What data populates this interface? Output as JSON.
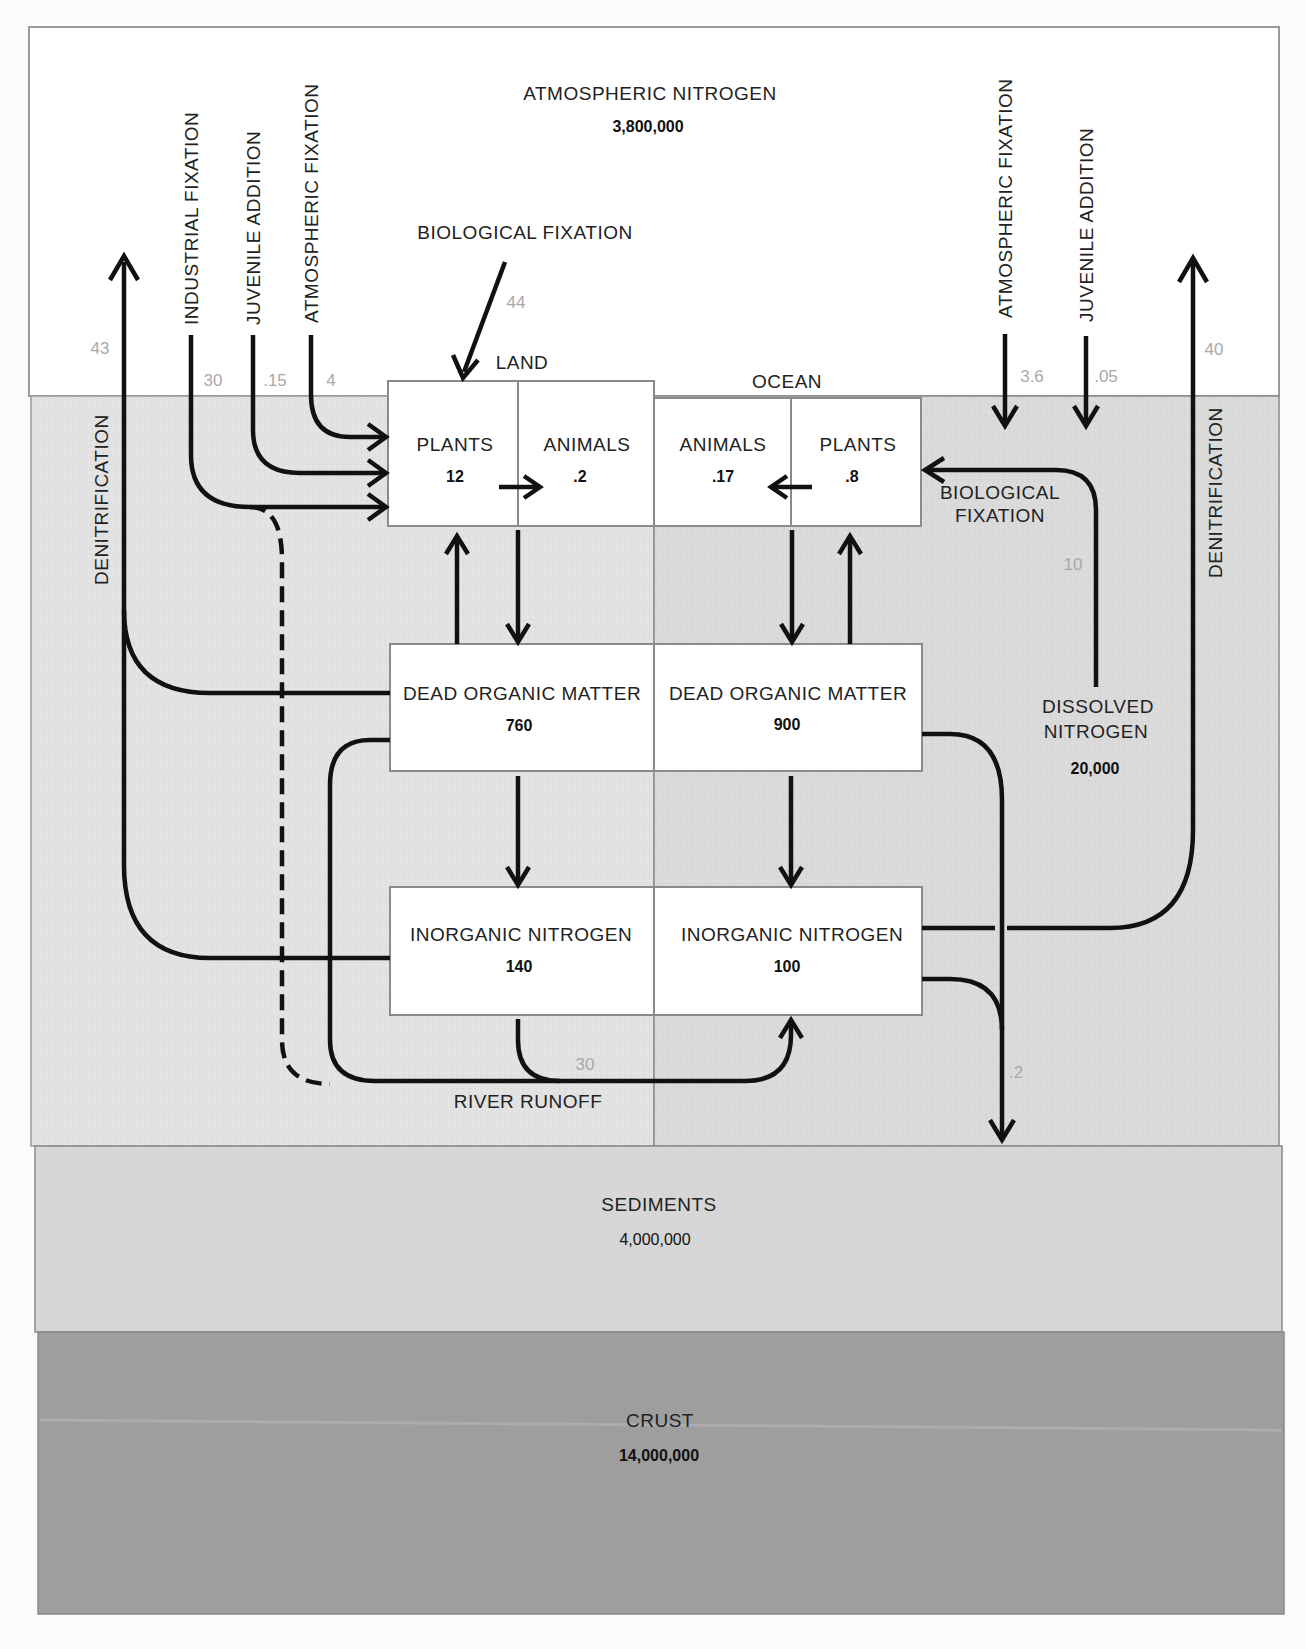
{
  "reservoirs": {
    "atmosphere": {
      "label": "ATMOSPHERIC NITROGEN",
      "value": "3,800,000"
    },
    "sediments": {
      "label": "SEDIMENTS",
      "value": "4,000,000"
    },
    "crust": {
      "label": "CRUST",
      "value": "14,000,000"
    },
    "dissolved": {
      "label_line1": "DISSOLVED",
      "label_line2": "NITROGEN",
      "value": "20,000"
    }
  },
  "regions": {
    "land": "LAND",
    "ocean": "OCEAN"
  },
  "boxes": {
    "land_plants": {
      "label": "PLANTS",
      "value": "12"
    },
    "land_animals": {
      "label": "ANIMALS",
      "value": ".2"
    },
    "ocean_animals": {
      "label": "ANIMALS",
      "value": ".17"
    },
    "ocean_plants": {
      "label": "PLANTS",
      "value": ".8"
    },
    "land_dead": {
      "label": "DEAD ORGANIC MATTER",
      "value": "760"
    },
    "ocean_dead": {
      "label": "DEAD ORGANIC MATTER",
      "value": "900"
    },
    "land_inorganic": {
      "label": "INORGANIC NITROGEN",
      "value": "140"
    },
    "ocean_inorganic": {
      "label": "INORGANIC NITROGEN",
      "value": "100"
    }
  },
  "process_labels": {
    "industrial_fixation": "INDUSTRIAL FIXATION",
    "juvenile_addition_land": "JUVENILE ADDITION",
    "atmospheric_fixation_land": "ATMOSPHERIC FIXATION",
    "biological_fixation_land": "BIOLOGICAL FIXATION",
    "atmospheric_fixation_ocean": "ATMOSPHERIC FIXATION",
    "juvenile_addition_ocean": "JUVENILE ADDITION",
    "denitrification_land": "DENITRIFICATION",
    "denitrification_ocean": "DENITRIFICATION",
    "biological_fixation_ocean_line1": "BIOLOGICAL",
    "biological_fixation_ocean_line2": "FIXATION",
    "river_runoff": "RIVER RUNOFF"
  },
  "flows": {
    "denitrification_land": "43",
    "industrial_fixation": "30",
    "juvenile_addition_land": ".15",
    "atmospheric_fixation_land": "4",
    "biological_fixation_land": "44",
    "atmospheric_fixation_ocean": "3.6",
    "juvenile_addition_ocean": ".05",
    "denitrification_ocean": "40",
    "biological_fixation_ocean": "10",
    "river_runoff": "30",
    "sedimentation": ".2"
  }
}
